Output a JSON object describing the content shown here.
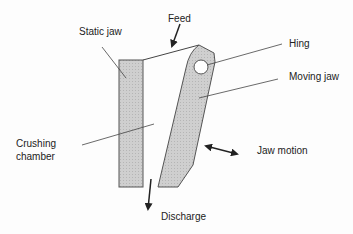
{
  "diagram": {
    "labels": {
      "static_jaw": "Static jaw",
      "feed": "Feed",
      "hinge": "Hing",
      "moving_jaw": "Moving jaw",
      "crushing_chamber_line1": "Crushing",
      "crushing_chamber_line2": "chamber",
      "jaw_motion": "Jaw motion",
      "discharge": "Discharge"
    },
    "colors": {
      "jaw_fill": "#c8c8c8",
      "stroke": "#444444",
      "text": "#222222"
    }
  }
}
